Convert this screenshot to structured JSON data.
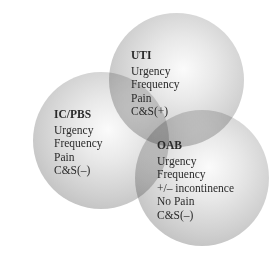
{
  "diagram": {
    "type": "venn",
    "sets": [
      {
        "id": "uti",
        "title": "UTI",
        "items": [
          "Urgency",
          "Frequency",
          "Pain",
          "C&S(+)"
        ]
      },
      {
        "id": "icpbs",
        "title": "IC/PBS",
        "items": [
          "Urgency",
          "Frequency",
          "Pain",
          "C&S(–)"
        ]
      },
      {
        "id": "oab",
        "title": "OAB",
        "items": [
          "Urgency",
          "Frequency",
          "+/– incontinence",
          "No Pain",
          "C&S(–)"
        ]
      }
    ],
    "colors": {
      "circle_center": "#fbfbfb",
      "circle_edge": "#b3b3b3",
      "text": "#2a2a2a",
      "background": "#ffffff"
    }
  }
}
